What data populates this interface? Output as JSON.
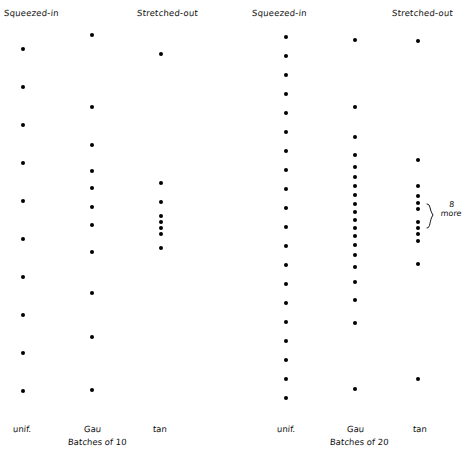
{
  "figure": {
    "width": 462,
    "height": 452,
    "background": "#ffffff",
    "dot_color": "#000000",
    "text_color": "#111111"
  },
  "headers": [
    {
      "label": "Squeezed-in",
      "x": 4,
      "y": 8
    },
    {
      "label": "Stretched-out",
      "x": 137,
      "y": 8
    },
    {
      "label": "Squeezed-in",
      "x": 252,
      "y": 8
    },
    {
      "label": "Stretched-out",
      "x": 392,
      "y": 8
    }
  ],
  "groups": [
    {
      "caption": "Batches of 10",
      "x": 68,
      "y": 437
    },
    {
      "caption": "Batches of 20",
      "x": 330,
      "y": 437
    }
  ],
  "columns": [
    {
      "name": "uniform-batches-10",
      "footer": "unif.",
      "footer_x": 13,
      "footer_y": 424,
      "center_x": 23,
      "n": 10,
      "dots_y": [
        49,
        87,
        125,
        163,
        201,
        239,
        277,
        315,
        353,
        391
      ]
    },
    {
      "name": "gaussian-batches-10",
      "footer": "Gau",
      "footer_x": 84,
      "footer_y": 424,
      "center_x": 92,
      "n": 10,
      "dots_y": [
        35,
        107,
        145,
        171,
        188,
        207,
        225,
        252,
        293,
        337,
        390
      ]
    },
    {
      "name": "cauchy-batches-10",
      "footer": "tan",
      "footer_x": 153,
      "footer_y": 424,
      "center_x": 161,
      "n": 10,
      "dots_y": [
        54,
        183,
        202,
        216,
        222,
        228,
        234,
        248
      ]
    },
    {
      "name": "uniform-batches-20",
      "footer": "unif.",
      "footer_x": 277,
      "footer_y": 424,
      "center_x": 286,
      "n": 20,
      "dots_y": [
        37,
        56,
        75,
        94,
        113,
        132,
        151,
        170,
        189,
        208,
        227,
        246,
        265,
        284,
        303,
        322,
        341,
        360,
        379,
        398
      ]
    },
    {
      "name": "gaussian-batches-20",
      "footer": "Gau",
      "footer_x": 347,
      "footer_y": 424,
      "center_x": 355,
      "n": 20,
      "dots_y": [
        40,
        107,
        137,
        155,
        167,
        177,
        186,
        195,
        204,
        212,
        220,
        228,
        236,
        245,
        255,
        267,
        282,
        300,
        323,
        389
      ]
    },
    {
      "name": "cauchy-batches-20",
      "footer": "tan",
      "footer_x": 413,
      "footer_y": 424,
      "center_x": 418,
      "n": 20,
      "dots_y": [
        41,
        160,
        186,
        196,
        203,
        209,
        222,
        228,
        234,
        241,
        264,
        379
      ]
    }
  ],
  "annotation": {
    "name": "eight-more-brace",
    "count": "8",
    "word": "more",
    "text_x": 441,
    "text_y": 200,
    "brace_x": 425,
    "brace_y": 202,
    "brace_height": 26
  }
}
